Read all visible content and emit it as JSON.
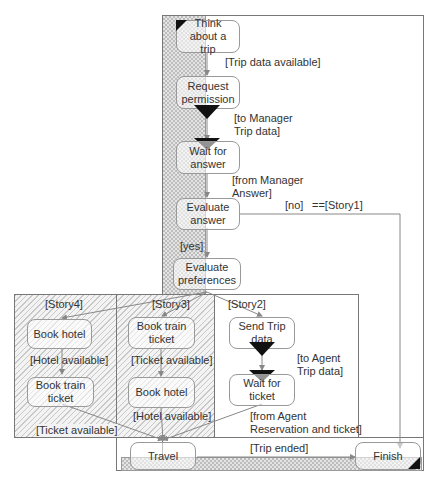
{
  "diagram": {
    "type": "activity-diagram",
    "nodes": {
      "think": "Think about a trip",
      "request": "Request permission",
      "wait_answer": "Wait for answer",
      "evaluate_answer": "Evaluate answer",
      "evaluate_prefs": "Evaluate preferences",
      "s4_book_hotel": "Book hotel",
      "s4_book_train": "Book train ticket",
      "s3_book_train": "Book train ticket",
      "s3_book_hotel": "Book hotel",
      "s2_send_trip": "Send Trip data",
      "s2_wait_ticket": "Wait for ticket",
      "travel": "Travel",
      "finish": "Finish"
    },
    "labels": {
      "trip_data_available": "[Trip data available]",
      "to_manager_1": "[to Manager",
      "to_manager_2": "Trip data]",
      "from_manager_1": "[from Manager",
      "from_manager_2": "Answer]",
      "no": "[no]",
      "story1": "==[Story1]",
      "yes": "[yes]",
      "story4": "[Story4]",
      "story3": "[Story3]",
      "story2": "[Story2]",
      "hotel_available_s4": "[Hotel available]",
      "ticket_available_s4": "[Ticket available]",
      "ticket_available_s3": "[Ticket available]",
      "hotel_available_s3": "[Hotel available]",
      "to_agent_1": "[to Agent",
      "to_agent_2": "Trip data]",
      "from_agent_1": "[from Agent",
      "from_agent_2": "Reservation and ticket]",
      "trip_ended": "[Trip ended]"
    },
    "colors": {
      "line": "#888888",
      "frame": "#777777",
      "marker": "#111111"
    }
  }
}
